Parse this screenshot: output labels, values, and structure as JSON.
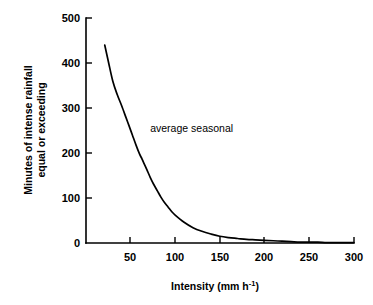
{
  "chart_data": {
    "type": "line",
    "title": "",
    "xlabel": "Intensity (mm h-1)",
    "xlabel_main": "Intensity (mm h",
    "xlabel_sup": "-1",
    "xlabel_tail": ")",
    "ylabel_line1": "Minutes of intense rainfall",
    "ylabel_line2": "equal or exceeding",
    "xlim": [
      0,
      300
    ],
    "ylim": [
      0,
      500
    ],
    "grid": false,
    "legend_position": "inline-annotation",
    "xticks": [
      50,
      100,
      150,
      200,
      250,
      300
    ],
    "xtick_labels": [
      "50",
      "100",
      "150",
      "200",
      "250",
      "300"
    ],
    "yticks": [
      0,
      100,
      200,
      300,
      400,
      500
    ],
    "ytick_labels": [
      "0",
      "100",
      "200",
      "300",
      "400",
      "500"
    ],
    "series": [
      {
        "name": "average seasonal",
        "annotation": "average seasonal",
        "annotation_x": 72,
        "annotation_y": 247,
        "color": "#000000",
        "x": [
          21,
          25,
          30,
          35,
          40,
          45,
          48,
          52,
          56,
          60,
          63,
          68,
          72,
          76,
          80,
          84,
          88,
          92,
          96,
          100,
          110,
          120,
          130,
          140,
          150,
          160,
          170,
          180,
          190,
          200,
          210,
          220,
          230,
          240,
          250,
          260,
          270,
          280,
          290,
          300
        ],
        "y": [
          440,
          404,
          360,
          330,
          305,
          278,
          262,
          240,
          218,
          198,
          186,
          164,
          146,
          130,
          116,
          102,
          90,
          80,
          70,
          62,
          46,
          34,
          26,
          20,
          15,
          12,
          10,
          8,
          7,
          6,
          5,
          4,
          3,
          2,
          2,
          2,
          1,
          1,
          1,
          1
        ]
      }
    ]
  },
  "axes_geometry": {
    "origin_x_px": 86,
    "origin_y_px": 243,
    "x_px_per_unit": 0.8917,
    "y_px_per_unit": 0.45,
    "y_top_px": 18
  },
  "colors": {
    "background": "#ffffff",
    "foreground": "#000000",
    "curve": "#000000"
  }
}
